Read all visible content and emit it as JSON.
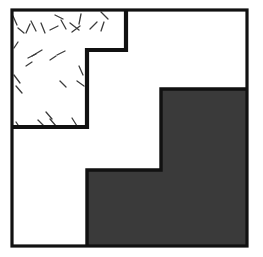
{
  "figure": {
    "canvas": {
      "width": 263,
      "height": 257,
      "background": "#ffffff"
    },
    "colors": {
      "outline": "#111111",
      "fill_shaded": "#3a3a3a",
      "fill_plain": "#ffffff",
      "hatch_stroke": "#3c3c3c",
      "background": "#ffffff"
    },
    "stroke_widths": {
      "outer_frame": 3.2,
      "step_divider": 4.2,
      "shaded_outline": 3.4,
      "hatch": 1.3
    },
    "frame": {
      "left": 12,
      "top": 10,
      "right": 247,
      "bottom": 246
    },
    "regions": [
      {
        "name": "hatched-region",
        "label": "hatched stepped region",
        "fill": "#ffffff",
        "pattern": "diagonal-dashes",
        "points": "12,10 126,10 126,50 87,50 87,127 12,127"
      },
      {
        "name": "plain-region",
        "label": "plain white region",
        "fill": "#ffffff",
        "pattern": "none",
        "points": "126,10 247,10 247,89 161,89 161,170 87,170 87,246 12,246 12,127 87,127 87,50 126,50"
      },
      {
        "name": "shaded-region",
        "label": "solid dark-gray stepped region",
        "fill": "#3a3a3a",
        "pattern": "solid",
        "points": "161,89 247,89 247,246 87,246 87,170 161,170"
      }
    ],
    "step_divider_path": "M126,10 L126,50 L87,50 L87,127 L12,127",
    "shaded_outline_path": "M247,89 L161,89 L161,170 L87,170 L87,246",
    "hatch_marks": [
      {
        "x1": 13,
        "y1": 16,
        "x2": 17,
        "y2": 25
      },
      {
        "x1": 18,
        "y1": 28,
        "x2": 24,
        "y2": 33
      },
      {
        "x1": 26,
        "y1": 33,
        "x2": 30,
        "y2": 24
      },
      {
        "x1": 31,
        "y1": 21,
        "x2": 36,
        "y2": 31
      },
      {
        "x1": 41,
        "y1": 23,
        "x2": 45,
        "y2": 33
      },
      {
        "x1": 50,
        "y1": 30,
        "x2": 58,
        "y2": 26
      },
      {
        "x1": 61,
        "y1": 20,
        "x2": 66,
        "y2": 29
      },
      {
        "x1": 55,
        "y1": 15,
        "x2": 63,
        "y2": 19
      },
      {
        "x1": 70,
        "y1": 23,
        "x2": 79,
        "y2": 30
      },
      {
        "x1": 72,
        "y1": 32,
        "x2": 80,
        "y2": 26
      },
      {
        "x1": 81,
        "y1": 14,
        "x2": 79,
        "y2": 24
      },
      {
        "x1": 90,
        "y1": 29,
        "x2": 97,
        "y2": 22
      },
      {
        "x1": 101,
        "y1": 12,
        "x2": 108,
        "y2": 19
      },
      {
        "x1": 101,
        "y1": 31,
        "x2": 104,
        "y2": 22
      },
      {
        "x1": 32,
        "y1": 56,
        "x2": 42,
        "y2": 50
      },
      {
        "x1": 28,
        "y1": 58,
        "x2": 36,
        "y2": 54
      },
      {
        "x1": 57,
        "y1": 55,
        "x2": 65,
        "y2": 51
      },
      {
        "x1": 50,
        "y1": 60,
        "x2": 56,
        "y2": 56
      },
      {
        "x1": 14,
        "y1": 48,
        "x2": 18,
        "y2": 42
      },
      {
        "x1": 14,
        "y1": 75,
        "x2": 20,
        "y2": 83
      },
      {
        "x1": 16,
        "y1": 86,
        "x2": 22,
        "y2": 93
      },
      {
        "x1": 79,
        "y1": 66,
        "x2": 83,
        "y2": 75
      },
      {
        "x1": 77,
        "y1": 81,
        "x2": 84,
        "y2": 86
      },
      {
        "x1": 60,
        "y1": 81,
        "x2": 66,
        "y2": 87
      },
      {
        "x1": 46,
        "y1": 112,
        "x2": 52,
        "y2": 119
      },
      {
        "x1": 38,
        "y1": 120,
        "x2": 44,
        "y2": 126
      },
      {
        "x1": 16,
        "y1": 122,
        "x2": 20,
        "y2": 128
      },
      {
        "x1": 50,
        "y1": 119,
        "x2": 56,
        "y2": 126
      },
      {
        "x1": 72,
        "y1": 118,
        "x2": 77,
        "y2": 126
      },
      {
        "x1": 26,
        "y1": 66,
        "x2": 32,
        "y2": 62
      }
    ]
  }
}
